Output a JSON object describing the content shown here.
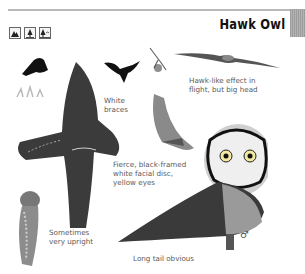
{
  "page": {
    "title": "Hawk Owl",
    "habitat_icons": [
      {
        "name": "mountain-habitat-icon"
      },
      {
        "name": "conifer-forest-habitat-icon"
      },
      {
        "name": "forest-edge-habitat-icon"
      }
    ],
    "captions": {
      "white_braces": "White\nbraces",
      "hawk_like": "Hawk-like effect in\nflight, but big head",
      "fierce": "Fierce, black-framed\nwhite facial disc,\nyellow eyes",
      "upright": "Sometimes\nvery upright",
      "long_tail": "Long tail obvious"
    },
    "sex_symbol": "♂"
  }
}
